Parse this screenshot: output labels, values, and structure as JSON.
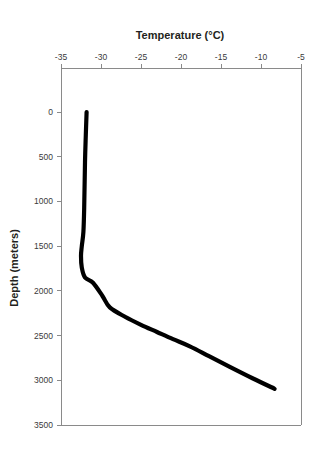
{
  "chart_data": {
    "type": "line",
    "title": "Temperature (°C)",
    "xlabel": "Temperature (°C)",
    "ylabel": "Depth (meters)",
    "xlim": [
      -35,
      -5
    ],
    "ylim": [
      0,
      3500
    ],
    "y_inverted": true,
    "x_axis_position": "top",
    "grid": false,
    "legend": false,
    "x_ticks": [
      -35,
      -30,
      -25,
      -20,
      -15,
      -10,
      -5
    ],
    "x_tick_labels": [
      "-35",
      "-30",
      "-25",
      "-20",
      "-15",
      "-10",
      "-5"
    ],
    "y_ticks": [
      0,
      500,
      1000,
      1500,
      2000,
      2500,
      3000,
      3500
    ],
    "y_tick_labels": [
      "0",
      "500",
      "1000",
      "1500",
      "2000",
      "2500",
      "3000",
      "3500"
    ],
    "series": [
      {
        "name": "ice-temperature-profile",
        "color": "#000000",
        "x": [
          -31.8,
          -31.9,
          -32.0,
          -32.1,
          -32.2,
          -32.4,
          -32.5,
          -32.4,
          -32.0,
          -31.0,
          -29.8,
          -28.9,
          -27.0,
          -25.0,
          -23.0,
          -21.0,
          -18.9,
          -16.5,
          -13.9,
          -11.0,
          -8.3
        ],
        "y": [
          0,
          260,
          560,
          1070,
          1340,
          1500,
          1610,
          1740,
          1850,
          1910,
          2060,
          2185,
          2290,
          2380,
          2460,
          2540,
          2620,
          2730,
          2850,
          2980,
          3095
        ]
      }
    ]
  },
  "axes": {
    "top_axis_title": "Temperature (°C)",
    "left_axis_title": "Depth (meters)"
  }
}
